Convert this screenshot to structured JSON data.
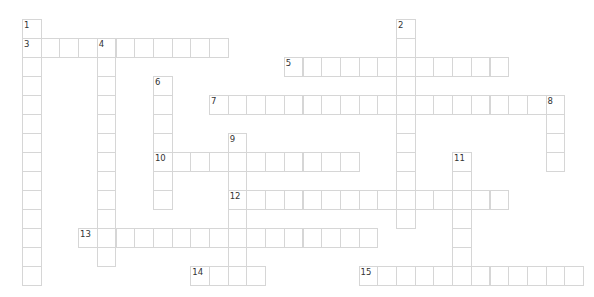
{
  "puzzle": {
    "type": "crossword",
    "grid": {
      "origin_x": 22,
      "origin_y": 19,
      "cell_w": 18.7,
      "cell_h": 19
    },
    "entries": [
      {
        "number": "1",
        "direction": "down",
        "row": 0,
        "col": 0,
        "length": 14
      },
      {
        "number": "2",
        "direction": "down",
        "row": 0,
        "col": 20,
        "length": 11
      },
      {
        "number": "3",
        "direction": "across",
        "row": 1,
        "col": 0,
        "length": 11
      },
      {
        "number": "4",
        "direction": "down",
        "row": 1,
        "col": 4,
        "length": 12
      },
      {
        "number": "5",
        "direction": "across",
        "row": 2,
        "col": 14,
        "length": 12
      },
      {
        "number": "6",
        "direction": "down",
        "row": 3,
        "col": 7,
        "length": 7
      },
      {
        "number": "7",
        "direction": "across",
        "row": 4,
        "col": 10,
        "length": 19
      },
      {
        "number": "8",
        "direction": "down",
        "row": 4,
        "col": 28,
        "length": 4
      },
      {
        "number": "9",
        "direction": "down",
        "row": 6,
        "col": 11,
        "length": 8
      },
      {
        "number": "10",
        "direction": "across",
        "row": 7,
        "col": 7,
        "length": 11
      },
      {
        "number": "11",
        "direction": "down",
        "row": 7,
        "col": 23,
        "length": 7
      },
      {
        "number": "12",
        "direction": "across",
        "row": 9,
        "col": 11,
        "length": 15
      },
      {
        "number": "13",
        "direction": "across",
        "row": 11,
        "col": 3,
        "length": 16
      },
      {
        "number": "14",
        "direction": "across",
        "row": 13,
        "col": 9,
        "length": 4
      },
      {
        "number": "15",
        "direction": "across",
        "row": 13,
        "col": 18,
        "length": 12
      }
    ]
  }
}
